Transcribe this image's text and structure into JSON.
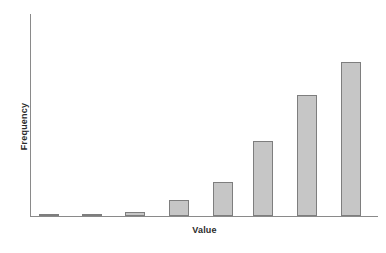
{
  "chart_data": {
    "type": "bar",
    "title": "",
    "subtitle": "",
    "xlabel": "Value",
    "ylabel": "Frequency",
    "categories": [
      "1",
      "2",
      "3",
      "4",
      "5",
      "6",
      "7",
      "8"
    ],
    "values": [
      1,
      1,
      2,
      8,
      17,
      37,
      60,
      76
    ],
    "ylim": [
      0,
      100
    ],
    "grid": false,
    "legend": null,
    "annotations": [],
    "tick_labels": {
      "x": [],
      "y": []
    },
    "series": [
      {
        "name": "Frequency",
        "values": [
          1,
          1,
          2,
          8,
          17,
          37,
          60,
          76
        ]
      }
    ],
    "bar_fill_color": "#c6c6c6",
    "bar_border_color": "#7e7e7e",
    "axis_color": "#8a8a8a",
    "label_color": "#2b2b2b"
  },
  "layout": {
    "bar_pitch_px": 43.4,
    "bar_width_px": 20,
    "plot_height_px": 202,
    "bar_heights_px": [
      2,
      2,
      4,
      16,
      34,
      75,
      121,
      154
    ],
    "bar_left_px": [
      8,
      51,
      94,
      138,
      182,
      222,
      266,
      310
    ]
  }
}
